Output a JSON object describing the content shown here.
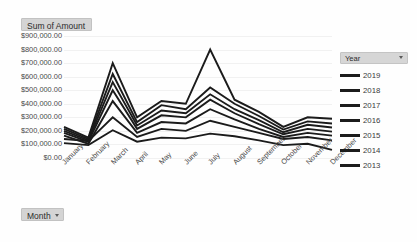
{
  "value_field": {
    "label": "Sum of Amount",
    "caret_icon": "chevron-down-icon"
  },
  "axis_field": {
    "label": "Month",
    "caret_icon": "chevron-down-icon"
  },
  "legend": {
    "header_label": "Year",
    "caret_icon": "chevron-down-icon"
  },
  "chart_data": {
    "type": "line",
    "title": "Sum of Amount",
    "xlabel": "Month",
    "ylabel": "Sum of Amount",
    "ylim": [
      0,
      900000
    ],
    "grid": true,
    "legend_position": "right",
    "legend_title": "Year",
    "y_tick_labels": [
      "$900,000.00",
      "$800,000.00",
      "$700,000.00",
      "$600,000.00",
      "$500,000.00",
      "$400,000.00",
      "$300,000.00",
      "$200,000.00",
      "$100,000.00",
      "$0.00"
    ],
    "y_tick_values": [
      900000,
      800000,
      700000,
      600000,
      500000,
      400000,
      300000,
      200000,
      100000,
      0
    ],
    "categories": [
      "January",
      "February",
      "March",
      "April",
      "May",
      "June",
      "July",
      "August",
      "September",
      "October",
      "November",
      "December"
    ],
    "series": [
      {
        "name": "2019",
        "color": "#1b1b1b",
        "values": [
          230000,
          150000,
          700000,
          300000,
          420000,
          400000,
          800000,
          430000,
          340000,
          230000,
          300000,
          290000
        ]
      },
      {
        "name": "2018",
        "color": "#1b1b1b",
        "values": [
          215000,
          140000,
          620000,
          265000,
          390000,
          360000,
          520000,
          400000,
          310000,
          210000,
          270000,
          255000
        ]
      },
      {
        "name": "2017",
        "color": "#1b1b1b",
        "values": [
          200000,
          130000,
          560000,
          240000,
          350000,
          330000,
          470000,
          360000,
          280000,
          190000,
          245000,
          225000
        ]
      },
      {
        "name": "2016",
        "color": "#1b1b1b",
        "values": [
          185000,
          120000,
          500000,
          215000,
          315000,
          300000,
          430000,
          330000,
          250000,
          175000,
          215000,
          195000
        ]
      },
      {
        "name": "2015",
        "color": "#1b1b1b",
        "values": [
          165000,
          105000,
          420000,
          185000,
          265000,
          255000,
          360000,
          285000,
          215000,
          155000,
          185000,
          165000
        ]
      },
      {
        "name": "2014",
        "color": "#1b1b1b",
        "values": [
          140000,
          125000,
          300000,
          155000,
          215000,
          200000,
          275000,
          230000,
          185000,
          140000,
          155000,
          130000
        ]
      },
      {
        "name": "2013",
        "color": "#1b1b1b",
        "values": [
          110000,
          95000,
          205000,
          120000,
          150000,
          145000,
          180000,
          160000,
          130000,
          95000,
          105000,
          60000
        ]
      }
    ]
  }
}
